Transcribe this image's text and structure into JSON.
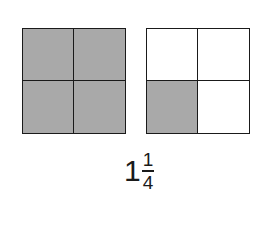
{
  "diagram": {
    "squares": [
      {
        "cells": [
          true,
          true,
          true,
          true
        ]
      },
      {
        "cells": [
          false,
          false,
          true,
          false
        ]
      }
    ],
    "label": {
      "whole": "1",
      "numerator": "1",
      "denominator": "4"
    },
    "colors": {
      "shaded": "#a9a9a9",
      "empty": "#ffffff",
      "line": "#1a1a1a"
    }
  }
}
